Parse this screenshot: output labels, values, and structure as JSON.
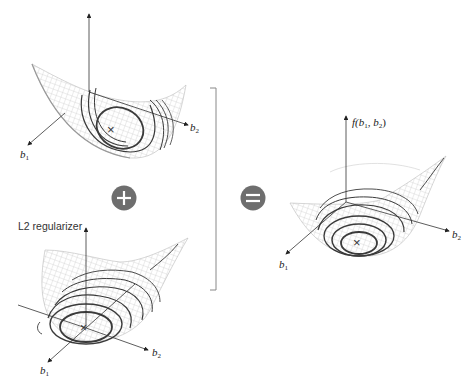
{
  "diagram": {
    "panels": [
      {
        "id": "loss",
        "title": "",
        "axes": {
          "vertical": "",
          "x1": "b",
          "x1_sub": "1",
          "x2": "b",
          "x2_sub": "2"
        },
        "minimum_marker": "×"
      },
      {
        "id": "l2",
        "title": "L2 regularizer",
        "axes": {
          "vertical": "",
          "x1": "b",
          "x1_sub": "1",
          "x2": "b",
          "x2_sub": "2"
        },
        "minimum_marker": "×"
      },
      {
        "id": "sum",
        "title": "",
        "axes": {
          "vertical_fn": "f(",
          "vertical_b1": "b",
          "vertical_b1_sub": "1",
          "vertical_sep": ", ",
          "vertical_b2": "b",
          "vertical_b2_sub": "2",
          "vertical_close": ")",
          "x1": "b",
          "x1_sub": "1",
          "x2": "b",
          "x2_sub": "2"
        },
        "minimum_marker": "×"
      }
    ],
    "operators": {
      "plus": "+",
      "equals": "="
    },
    "colors": {
      "operator_fill": "#6e6e6e",
      "contour": "#3a3a3a",
      "mesh": "#c8c8c8",
      "axis": "#333333",
      "bracket": "#888888"
    }
  }
}
